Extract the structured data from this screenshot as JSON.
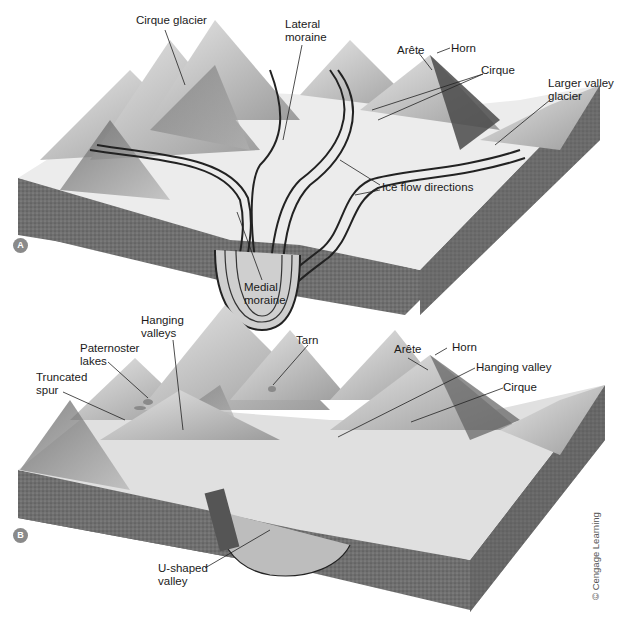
{
  "figure": {
    "credit": "© Cengage Learning",
    "panels": [
      {
        "id": "A",
        "badge": "A",
        "title": "Glaciated mountain landscape with active glaciers",
        "labels": {
          "cirque_glacier": "Cirque glacier",
          "lateral_moraine": "Lateral\nmoraine",
          "arete": "Arête",
          "horn": "Horn",
          "cirque": "Cirque",
          "larger_valley_glacier": "Larger valley\nglacier",
          "ice_flow_directions": "Ice flow directions",
          "medial_moraine": "Medial\nmoraine"
        }
      },
      {
        "id": "B",
        "badge": "B",
        "title": "Landscape after glaciers have melted",
        "labels": {
          "hanging_valleys": "Hanging\nvalleys",
          "paternoster_lakes": "Paternoster\nlakes",
          "truncated_spur": "Truncated\nspur",
          "tarn": "Tarn",
          "arete": "Arête",
          "horn": "Horn",
          "hanging_valley": "Hanging valley",
          "cirque": "Cirque",
          "u_shaped_valley": "U-shaped\nvalley"
        }
      }
    ]
  },
  "colors": {
    "rock_block": "#6e6e6e",
    "ice": "#ececec",
    "mountain_light": "#d9d9d9",
    "mountain_dark": "#5a5a5a",
    "badge": "#8a8a8a",
    "leader_line": "#222222"
  }
}
